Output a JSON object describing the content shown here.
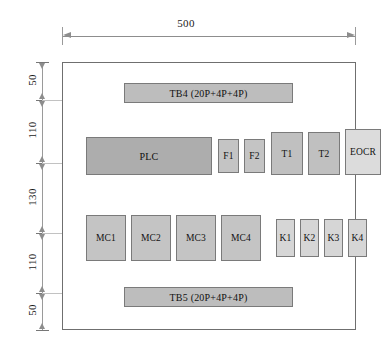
{
  "diagram": {
    "units": "mm",
    "overall_width_label": "500",
    "vertical_dimensions": [
      "50",
      "110",
      "130",
      "110",
      "50"
    ],
    "enclosure": {
      "name": "panel-enclosure",
      "border_color": "#6f6f6f",
      "fill": "#ffffff"
    },
    "colors": {
      "terminal_block_fill": "#bdbdbd",
      "plc_fill": "#adadad",
      "fuse_fill": "#c4c4c4",
      "transformer_fill": "#c0c0c0",
      "eocr_fill": "#dcdcdc",
      "contactor_fill": "#c4c4c4",
      "relay_fill": "#d6d6d6",
      "line_color": "#7a7a7a",
      "dimension_color": "#8d8d8d"
    },
    "rows": {
      "top_terminal": {
        "label": "TB4 (20P+4P+4P)"
      },
      "bottom_terminal": {
        "label": "TB5 (20P+4P+4P)"
      },
      "control_row": [
        {
          "label": "PLC",
          "type": "plc"
        },
        {
          "label": "F1",
          "type": "fuse"
        },
        {
          "label": "F2",
          "type": "fuse"
        },
        {
          "label": "T1",
          "type": "transformer"
        },
        {
          "label": "T2",
          "type": "transformer"
        },
        {
          "label": "EOCR",
          "type": "eocr"
        }
      ],
      "power_row": [
        {
          "label": "MC1",
          "type": "contactor"
        },
        {
          "label": "MC2",
          "type": "contactor"
        },
        {
          "label": "MC3",
          "type": "contactor"
        },
        {
          "label": "MC4",
          "type": "contactor"
        },
        {
          "label": "K1",
          "type": "relay"
        },
        {
          "label": "K2",
          "type": "relay"
        },
        {
          "label": "K3",
          "type": "relay"
        },
        {
          "label": "K4",
          "type": "relay"
        }
      ]
    }
  }
}
